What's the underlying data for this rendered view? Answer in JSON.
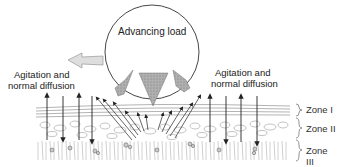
{
  "diagram": {
    "load_label": "Advancing load",
    "left_label_line1": "Agitation and",
    "left_label_line2": "normal diffusion",
    "right_label_line1": "Agitation and",
    "right_label_line2": "normal diffusion",
    "zones": [
      {
        "label": "Zone I"
      },
      {
        "label": "Zone II"
      },
      {
        "label": "Zone III"
      }
    ],
    "colors": {
      "line": "#333333",
      "arrow_fill": "#d8d8d8",
      "load_fill": "#9a9a9a",
      "tissue": "#555555"
    }
  }
}
